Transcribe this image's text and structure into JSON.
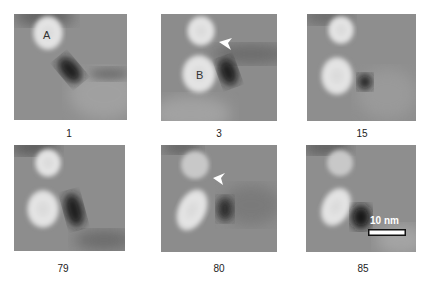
{
  "figure": {
    "panels": [
      {
        "frame_label": "1",
        "particle_labels": [
          "A"
        ],
        "arrowhead": false
      },
      {
        "frame_label": "3",
        "particle_labels": [
          "B"
        ],
        "arrowhead": true
      },
      {
        "frame_label": "15",
        "particle_labels": [],
        "arrowhead": false
      },
      {
        "frame_label": "79",
        "particle_labels": [],
        "arrowhead": false
      },
      {
        "frame_label": "80",
        "particle_labels": [],
        "arrowhead": true
      },
      {
        "frame_label": "85",
        "particle_labels": [],
        "arrowhead": false
      }
    ],
    "scale_bar": {
      "label": "10 nm"
    },
    "colors": {
      "background": "#8e8e8e",
      "particle": "#e8e8e8",
      "dark_spot": "#1a1a1a",
      "annotation": "#ffffff"
    }
  }
}
